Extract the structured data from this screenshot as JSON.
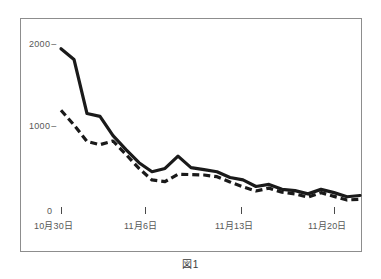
{
  "figure": {
    "caption": "図1"
  },
  "chart_data": {
    "type": "line",
    "title": "",
    "xlabel": "",
    "ylabel": "",
    "ylim": [
      0,
      2200
    ],
    "grid": false,
    "legend_position": "none",
    "y_ticks": [
      {
        "value": 0,
        "label": "0"
      },
      {
        "value": 1000,
        "label": "1000"
      },
      {
        "value": 2000,
        "label": "2000"
      }
    ],
    "x_ticks": [
      {
        "index": 0,
        "label": "10月30日"
      },
      {
        "index": 7,
        "label": "11月6日"
      },
      {
        "index": 14,
        "label": "11月13日"
      },
      {
        "index": 21,
        "label": "11月20日"
      }
    ],
    "x": [
      "10月30日",
      "10月31日",
      "11月1日",
      "11月2日",
      "11月3日",
      "11月4日",
      "11月5日",
      "11月6日",
      "11月7日",
      "11月8日",
      "11月9日",
      "11月10日",
      "11月11日",
      "11月12日",
      "11月13日",
      "11月14日",
      "11月15日",
      "11月16日",
      "11月17日",
      "11月18日",
      "11月19日",
      "11月20日",
      "11月21日",
      "11月22日"
    ],
    "series": [
      {
        "name": "solid-series",
        "style": "solid",
        "color": "#1a1a1a",
        "values": [
          1930,
          1800,
          1140,
          1105,
          870,
          700,
          540,
          430,
          470,
          620,
          480,
          455,
          430,
          360,
          330,
          250,
          275,
          215,
          200,
          160,
          215,
          175,
          125,
          140
        ]
      },
      {
        "name": "dashed-series",
        "style": "dashed",
        "color": "#1a1a1a",
        "values": [
          1180,
          1000,
          800,
          760,
          805,
          640,
          470,
          330,
          310,
          400,
          395,
          390,
          370,
          305,
          245,
          195,
          230,
          180,
          160,
          120,
          175,
          130,
          85,
          95
        ]
      }
    ]
  }
}
